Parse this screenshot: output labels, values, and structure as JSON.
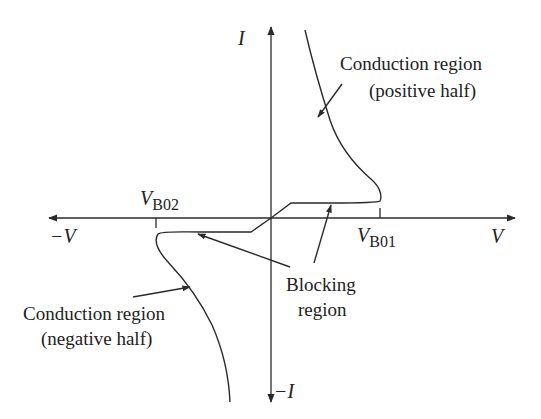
{
  "diagram": {
    "axes": {
      "x_positive_label": "V",
      "x_negative_label": "−V",
      "y_positive_label": "I",
      "y_negative_label": "−I"
    },
    "markers": {
      "vb01": {
        "main": "V",
        "sub": "B01"
      },
      "vb02": {
        "main": "V",
        "sub": "B02"
      }
    },
    "annotations": {
      "positive_conduction": {
        "line1": "Conduction region",
        "line2": "(positive half)"
      },
      "negative_conduction": {
        "line1": "Conduction region",
        "line2": "(negative half)"
      },
      "blocking": {
        "line1": "Blocking",
        "line2": "region"
      }
    },
    "colors": {
      "ink": "#2a2a2a",
      "background": "#ffffff"
    }
  }
}
